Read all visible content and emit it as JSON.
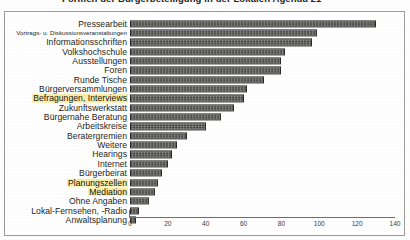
{
  "title": {
    "text": "Formen der Bürgerbeteiligung in der Lokalen Agenda 21",
    "clipped": true
  },
  "chart_data": {
    "type": "bar",
    "orientation": "horizontal",
    "title": "Formen der Bürgerbeteiligung in der Lokalen Agenda 21",
    "xlabel": "",
    "ylabel": "",
    "xlim": [
      0,
      140
    ],
    "xticks": [
      "0",
      "20",
      "40",
      "60",
      "80",
      "100",
      "120",
      "140"
    ],
    "grid": false,
    "legend": null,
    "categories": [
      "Pressearbeit",
      "Vortrags- u. Diskussionsveranstaltungen",
      "Informationsschriften",
      "Volkshochschule",
      "Ausstellungen",
      "Foren",
      "Runde Tische",
      "Bürgerversammlungen",
      "Befragungen, Interviews",
      "Zukunftswerkstatt",
      "Bürgernahe Beratung",
      "Arbeitskreise",
      "Beratergremien",
      "Weitere",
      "Hearings",
      "Internet",
      "Bürgerbeirat",
      "Planungszellen",
      "Mediation",
      "Ohne Angaben",
      "Lokal-Fernsehen, -Radio",
      "Anwaltsplanung"
    ],
    "values": [
      130,
      99,
      96,
      82,
      80,
      80,
      71,
      62,
      60,
      55,
      48,
      40,
      30,
      25,
      22,
      20,
      17,
      15,
      13,
      10,
      5,
      3
    ],
    "highlighted": [
      "Befragungen, Interviews",
      "Planungszellen",
      "Mediation"
    ],
    "highlight_color": "#f7eda8",
    "bar_color": "#4c4c49"
  }
}
